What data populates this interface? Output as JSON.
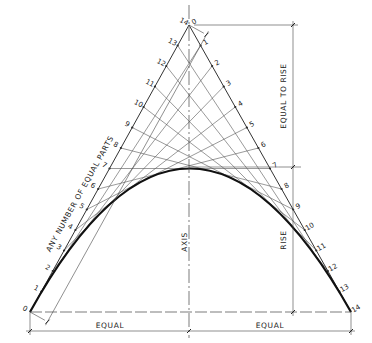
{
  "diagram": {
    "labels": {
      "left_side": "ANY NUMBER OF EQUAL PARTS",
      "right_upper": "EQUAL TO RISE",
      "right_lower": "RISE",
      "axis": "AXIS",
      "bottom_left": "EQUAL",
      "bottom_right": "EQUAL"
    },
    "divisions": 14,
    "left_numbers": [
      "0",
      "1",
      "2",
      "3",
      "4",
      "5",
      "6",
      "7",
      "8",
      "9",
      "10",
      "11",
      "12",
      "13",
      "14"
    ],
    "right_numbers": [
      "0",
      "1",
      "2",
      "3",
      "4",
      "5",
      "6",
      "7",
      "8",
      "9",
      "10",
      "11",
      "12",
      "13",
      "14"
    ],
    "geometry": {
      "left_base": [
        30,
        312
      ],
      "apex": [
        189,
        25
      ],
      "right_base": [
        351,
        312
      ],
      "vertex_y": 168,
      "rise_mark_y": 167,
      "dimension_x": 293,
      "bottom_dim_y": 331
    },
    "colors": {
      "line": "#333333",
      "construction": "#555555",
      "curve": "#111111",
      "background": "#ffffff"
    }
  }
}
